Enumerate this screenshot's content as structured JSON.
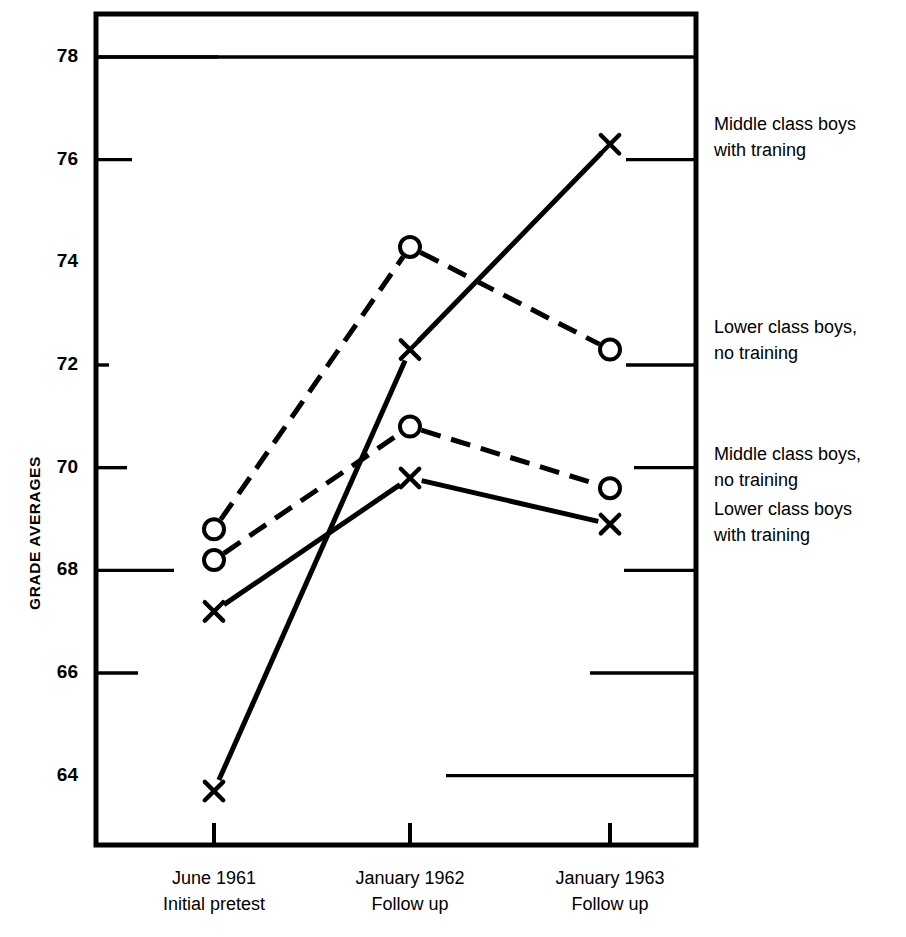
{
  "chart_data": {
    "type": "line",
    "title": "",
    "xlabel": "",
    "ylabel": "GRADE AVERAGES",
    "categories": [
      "June 1961 Initial pretest",
      "January 1962 Follow up",
      "January 1963 Follow up"
    ],
    "x_tick_labels": [
      {
        "line1": "June 1961",
        "line2": "Initial pretest"
      },
      {
        "line1": "January 1962",
        "line2": "Follow up"
      },
      {
        "line1": "January 1963",
        "line2": "Follow up"
      }
    ],
    "y_tick_labels": [
      "78",
      "76",
      "74",
      "72",
      "70",
      "68",
      "66",
      "64"
    ],
    "y_ticks": [
      78,
      76,
      74,
      72,
      70,
      68,
      66,
      64
    ],
    "ylim": [
      62.8,
      78.8
    ],
    "grid": false,
    "legend_position": "right-of-axis",
    "series": [
      {
        "name": "Middle class boys with traning",
        "marker": "x",
        "linestyle": "solid",
        "color": "#000000",
        "values": [
          63.7,
          72.3,
          76.3
        ],
        "label_line1": "Middle class boys",
        "label_line2": "with traning"
      },
      {
        "name": "Lower class boys, no training",
        "marker": "circle",
        "linestyle": "dashed",
        "color": "#000000",
        "values": [
          68.8,
          74.3,
          72.3
        ],
        "label_line1": "Lower class boys,",
        "label_line2": "no training"
      },
      {
        "name": "Middle class boys, no training",
        "marker": "circle",
        "linestyle": "dashed",
        "color": "#000000",
        "values": [
          68.2,
          70.8,
          69.6
        ],
        "label_line1": "Middle class boys,",
        "label_line2": "no training"
      },
      {
        "name": "Lower class boys with training",
        "marker": "x",
        "linestyle": "solid",
        "color": "#000000",
        "values": [
          67.2,
          69.8,
          68.9
        ],
        "label_line1": "Lower class boys",
        "label_line2": "with training"
      }
    ]
  },
  "legend": {
    "entries": [
      {
        "line1": "Middle class boys",
        "line2": "with traning"
      },
      {
        "line1": "Lower class boys,",
        "line2": "no training"
      },
      {
        "line1": "Middle class boys,",
        "line2": "no training"
      },
      {
        "line1": "Lower class boys",
        "line2": "with training"
      }
    ]
  },
  "axis": {
    "y_title": "GRADE AVERAGES"
  },
  "colors": {
    "ink": "#000000",
    "background": "#ffffff"
  }
}
